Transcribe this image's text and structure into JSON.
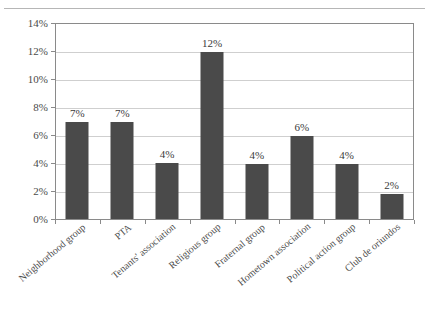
{
  "chart_data": {
    "type": "bar",
    "title": "",
    "title_cutoff": "",
    "xlabel": "",
    "ylabel": "",
    "ylim": [
      0,
      14
    ],
    "ytick_labels": [
      "0%",
      "2%",
      "4%",
      "6%",
      "8%",
      "10%",
      "12%",
      "14%"
    ],
    "ytick_values": [
      0,
      2,
      4,
      6,
      8,
      10,
      12,
      14
    ],
    "grid": true,
    "legend": "none",
    "categories": [
      "Neighborhood group",
      "PTA",
      "Tenants' association",
      "Religious group",
      "Fraternal group",
      "Hometown association",
      "Political action group",
      "Club de oriundos"
    ],
    "values": [
      6.9,
      6.9,
      4.0,
      11.9,
      3.9,
      5.9,
      3.9,
      1.8
    ],
    "data_labels": [
      "7%",
      "7%",
      "4%",
      "12%",
      "4%",
      "6%",
      "4%",
      "2%"
    ],
    "bar_color": "#4a4a4a",
    "grid_color": "#cfcfcf",
    "axis_color": "#8a8a8a",
    "background_color": "#ffffff",
    "text_color": "#3a3a3a"
  }
}
